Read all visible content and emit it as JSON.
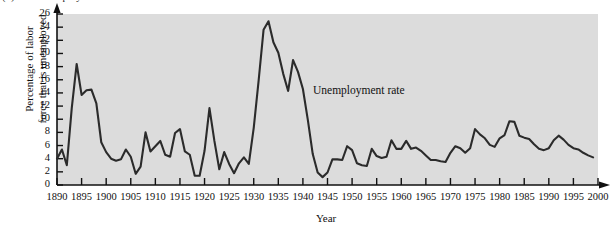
{
  "figure": {
    "caption": "(b)  The Unemployment Rate",
    "panel_bg": "#dcdcdc",
    "line_color": "#2b2b2b"
  },
  "annotation": {
    "label": "Unemployment rate"
  },
  "axes": {
    "x_title": "Year",
    "y_title_line1": "Percentage of labor",
    "y_title_line2": "force that is unemployed",
    "y_ticks": [
      "0",
      "2",
      "4",
      "6",
      "8",
      "10",
      "12",
      "14",
      "16",
      "18",
      "20",
      "22",
      "24",
      "26"
    ],
    "x_ticks": [
      "1890",
      "1895",
      "1900",
      "1905",
      "1910",
      "1915",
      "1920",
      "1925",
      "1930",
      "1935",
      "1940",
      "1945",
      "1950",
      "1955",
      "1960",
      "1965",
      "1970",
      "1975",
      "1980",
      "1985",
      "1990",
      "1995",
      "2000"
    ]
  },
  "chart_data": {
    "type": "line",
    "title": "(b)  The Unemployment Rate",
    "xlabel": "Year",
    "ylabel": "Percentage of labor force that is unemployed",
    "xlim": [
      1890,
      2000
    ],
    "ylim": [
      0,
      26
    ],
    "xtick_step": 5,
    "ytick_step": 2,
    "grid": false,
    "legend": "none",
    "annotations": [
      {
        "text": "Unemployment rate",
        "x": 1936,
        "y": 14.5
      }
    ],
    "series": [
      {
        "name": "Unemployment rate",
        "x": [
          1890,
          1891,
          1892,
          1893,
          1894,
          1895,
          1896,
          1897,
          1898,
          1899,
          1900,
          1901,
          1902,
          1903,
          1904,
          1905,
          1906,
          1907,
          1908,
          1909,
          1910,
          1911,
          1912,
          1913,
          1914,
          1915,
          1916,
          1917,
          1918,
          1919,
          1920,
          1921,
          1922,
          1923,
          1924,
          1925,
          1926,
          1927,
          1928,
          1929,
          1930,
          1931,
          1932,
          1933,
          1934,
          1935,
          1936,
          1937,
          1938,
          1939,
          1940,
          1941,
          1942,
          1943,
          1944,
          1945,
          1946,
          1947,
          1948,
          1949,
          1950,
          1951,
          1952,
          1953,
          1954,
          1955,
          1956,
          1957,
          1958,
          1959,
          1960,
          1961,
          1962,
          1963,
          1964,
          1965,
          1966,
          1967,
          1968,
          1969,
          1970,
          1971,
          1972,
          1973,
          1974,
          1975,
          1976,
          1977,
          1978,
          1979,
          1980,
          1981,
          1982,
          1983,
          1984,
          1985,
          1986,
          1987,
          1988,
          1989,
          1990,
          1991,
          1992,
          1993,
          1994,
          1995,
          1996,
          1997,
          1998,
          1999
        ],
        "values": [
          4.0,
          5.4,
          3.0,
          11.7,
          18.4,
          13.7,
          14.4,
          14.5,
          12.4,
          6.5,
          5.0,
          4.0,
          3.7,
          3.9,
          5.4,
          4.3,
          1.7,
          2.8,
          8.0,
          5.1,
          5.9,
          6.7,
          4.6,
          4.3,
          7.9,
          8.5,
          5.1,
          4.6,
          1.4,
          1.4,
          5.2,
          11.7,
          6.7,
          2.4,
          5.0,
          3.2,
          1.8,
          3.3,
          4.2,
          3.2,
          8.7,
          15.9,
          23.6,
          24.9,
          21.7,
          20.1,
          16.9,
          14.3,
          19.0,
          17.2,
          14.6,
          9.9,
          4.7,
          1.9,
          1.2,
          1.9,
          3.9,
          3.9,
          3.8,
          5.9,
          5.3,
          3.3,
          3.0,
          2.9,
          5.5,
          4.4,
          4.1,
          4.3,
          6.8,
          5.5,
          5.5,
          6.7,
          5.5,
          5.7,
          5.2,
          4.5,
          3.8,
          3.8,
          3.6,
          3.5,
          4.9,
          5.9,
          5.6,
          4.9,
          5.6,
          8.5,
          7.7,
          7.1,
          6.1,
          5.8,
          7.1,
          7.6,
          9.7,
          9.6,
          7.5,
          7.2,
          7.0,
          6.2,
          5.5,
          5.3,
          5.6,
          6.8,
          7.5,
          6.9,
          6.1,
          5.6,
          5.4,
          4.9,
          4.5,
          4.2
        ]
      }
    ]
  }
}
